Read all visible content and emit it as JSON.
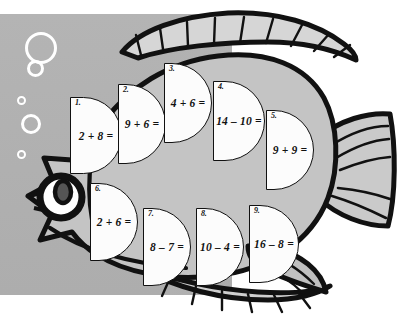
{
  "worksheet": {
    "title": "Fish math coloring worksheet",
    "subject_name": "fish",
    "background_color": "#b1b1b1",
    "fish_body_color": "#c8c8c8",
    "fish_fin_color": "#d0d0d0",
    "outline_color": "#111111",
    "scale_fill_color": "#fcfcfc"
  },
  "problems": [
    {
      "number": "1.",
      "equation": "2 + 8 ="
    },
    {
      "number": "2.",
      "equation": "9 + 6 ="
    },
    {
      "number": "3.",
      "equation": "4 + 6 ="
    },
    {
      "number": "4.",
      "equation": "14 – 10 ="
    },
    {
      "number": "5.",
      "equation": "9 + 9 ="
    },
    {
      "number": "6.",
      "equation": "2 + 6 ="
    },
    {
      "number": "7.",
      "equation": "8 – 7 ="
    },
    {
      "number": "8.",
      "equation": "10 – 4 ="
    },
    {
      "number": "9.",
      "equation": "16 – 8 ="
    }
  ],
  "decorations": {
    "bubbles": [
      {
        "name": "bubble-tiny-top"
      },
      {
        "name": "bubble-large"
      },
      {
        "name": "bubble-medium"
      },
      {
        "name": "bubble-small-ring"
      },
      {
        "name": "bubble-ring"
      },
      {
        "name": "bubble-dot"
      }
    ]
  },
  "fish_parts": {
    "eye": "eye",
    "dorsal_fin": "dorsal-fin",
    "tail_fin": "tail-fin",
    "pectoral_fin": "pectoral-fin",
    "anal_fin": "anal-fin",
    "mouth": "mouth",
    "body": "body"
  }
}
